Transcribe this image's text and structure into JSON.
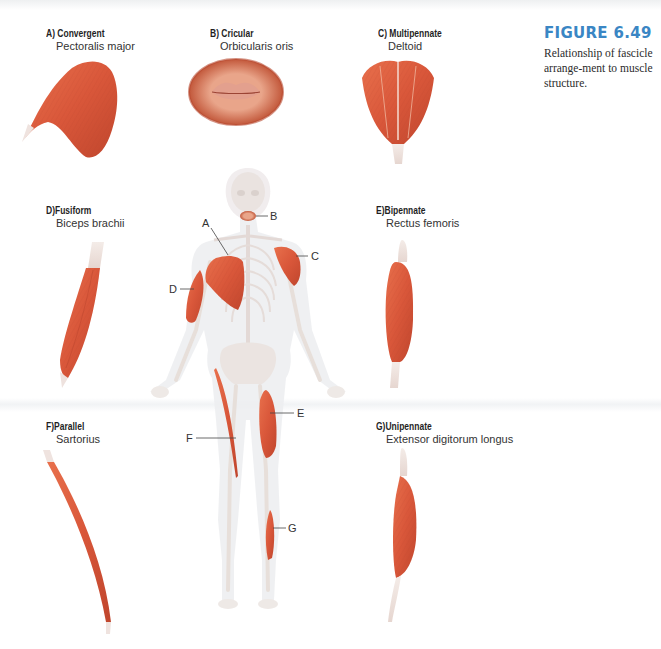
{
  "figure": {
    "number": "FIGURE 6.49",
    "caption": "Relationship of fascicle arrange-ment to muscle structure.",
    "accent_color": "#3a86c4",
    "muscle_color": "#d9573a"
  },
  "panels": [
    {
      "key": "A",
      "type": "A) Convergent",
      "muscle": "Pectoralis major"
    },
    {
      "key": "B",
      "type": "B) Cricular",
      "muscle": "Orbicularis oris"
    },
    {
      "key": "C",
      "type": "C) Multipennate",
      "muscle": "Deltoid"
    },
    {
      "key": "D",
      "type": "D)Fusiform",
      "muscle": "Biceps brachii"
    },
    {
      "key": "E",
      "type": "E)Bipennate",
      "muscle": "Rectus femoris"
    },
    {
      "key": "F",
      "type": "F)Parallel",
      "muscle": "Sartorius"
    },
    {
      "key": "G",
      "type": "G)Unipennate",
      "muscle": "Extensor digitorum longus"
    }
  ],
  "callouts": {
    "A": "A",
    "B": "B",
    "C": "C",
    "D": "D",
    "E": "E",
    "F": "F",
    "G": "G"
  }
}
